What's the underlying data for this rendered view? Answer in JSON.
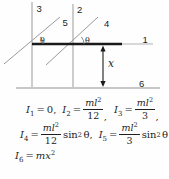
{
  "diagram": {
    "labels": {
      "axis1": "1",
      "axis2": "2",
      "axis3": "3",
      "axis4": "4",
      "axis5": "5",
      "axis6": "6",
      "theta_left": "θ",
      "theta_right": "θ",
      "x_dim": "x"
    },
    "colors": {
      "line_gray": "#9a9a9a",
      "rod_black": "#1a1a1a",
      "text": "#1c1c1c"
    }
  },
  "formulas": {
    "row1": {
      "e1": {
        "sym": "I",
        "sub": "1",
        "rel": "=",
        "rhs": "0,"
      },
      "e2": {
        "sym": "I",
        "sub": "2",
        "rel": "=",
        "num_base": "ml",
        "num_sup": "2",
        "den": "12",
        "tail": ","
      },
      "e3": {
        "sym": "I",
        "sub": "3",
        "rel": "=",
        "num_base": "ml",
        "num_sup": "2",
        "den": "3",
        "tail": ","
      }
    },
    "row2": {
      "e4": {
        "sym": "I",
        "sub": "4",
        "rel": "=",
        "num_base": "ml",
        "num_sup": "2",
        "den": "12",
        "fn": "sin",
        "fn_sup": "2",
        "fn_arg": "θ",
        "tail": ","
      },
      "e5": {
        "sym": "I",
        "sub": "5",
        "rel": "=",
        "num_base": "ml",
        "num_sup": "2",
        "den": "3",
        "fn": "sin",
        "fn_sup": "2",
        "fn_arg": "θ"
      }
    },
    "row3": {
      "e6": {
        "sym": "I",
        "sub": "6",
        "rel": "=",
        "rhs_base": "mx",
        "rhs_sup": "2"
      }
    }
  }
}
